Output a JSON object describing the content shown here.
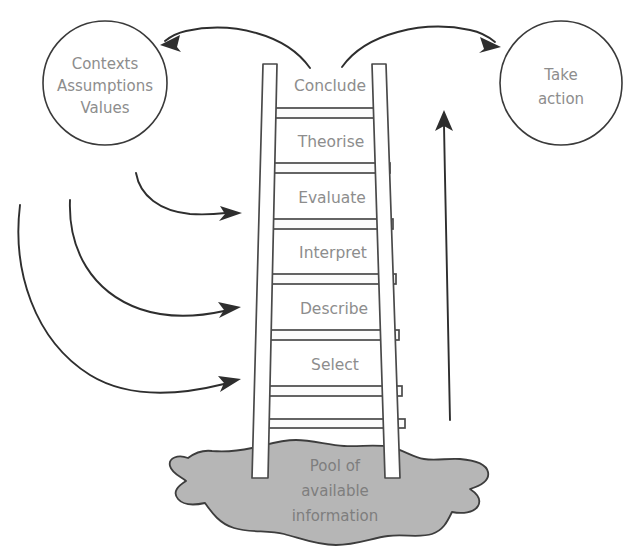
{
  "diagram": {
    "background_color": "#ffffff",
    "ink_color": "#2e2e2e",
    "text_color": "#8d8d8d",
    "pool_fill_color": "#b6b6b6"
  },
  "left_circle": {
    "name": "contexts-assumptions-values",
    "line1": "Contexts",
    "line2": "Assumptions",
    "line3": "Values"
  },
  "right_circle": {
    "name": "take-action",
    "line1": "Take",
    "line2": "action"
  },
  "ladder": {
    "name": "ladder-of-inference",
    "rungs": [
      {
        "label": "Conclude"
      },
      {
        "label": "Theorise"
      },
      {
        "label": "Evaluate"
      },
      {
        "label": "Interpret"
      },
      {
        "label": "Describe"
      },
      {
        "label": "Select"
      }
    ]
  },
  "pool": {
    "name": "pool-of-available-information",
    "line1": "Pool of",
    "line2": "available",
    "line3": "information"
  },
  "arrows": {
    "top_left": {
      "name": "arrow-conclude-to-contexts"
    },
    "top_right": {
      "name": "arrow-conclude-to-take-action"
    },
    "side_upward": {
      "name": "arrow-upward-progression"
    },
    "inflow_top": {
      "name": "arrow-inflow-to-evaluate"
    },
    "inflow_middle": {
      "name": "arrow-inflow-to-describe"
    },
    "inflow_bottom": {
      "name": "arrow-inflow-to-select"
    }
  }
}
